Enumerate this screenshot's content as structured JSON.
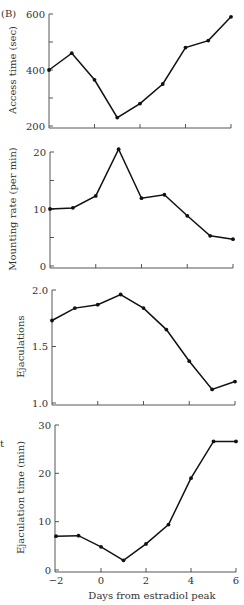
{
  "panel_label": "(B)",
  "edge_fragments": [
    "t"
  ],
  "chart_data": [
    {
      "type": "line",
      "title": "",
      "xlabel": "",
      "ylabel": "Access time (sec)",
      "x": [
        -2,
        -1,
        0,
        1,
        2,
        3,
        4,
        5,
        6
      ],
      "values": [
        400,
        460,
        365,
        230,
        280,
        350,
        480,
        505,
        590
      ],
      "ylim": [
        200,
        600
      ],
      "xlim": [
        -2,
        6
      ],
      "yticks": [
        200,
        300,
        400,
        500,
        600
      ],
      "ytick_labels": [
        "200",
        "",
        "400",
        "",
        "600"
      ],
      "xticks": [
        -2,
        0,
        2,
        4,
        6
      ],
      "xtick_labels": [],
      "grid": false
    },
    {
      "type": "line",
      "title": "",
      "xlabel": "",
      "ylabel": "Mounting rate (per min)",
      "x": [
        -2,
        -1,
        0,
        1,
        2,
        3,
        4,
        5,
        6
      ],
      "values": [
        10.0,
        10.2,
        12.3,
        20.5,
        11.9,
        12.5,
        8.8,
        5.3,
        4.7
      ],
      "ylim": [
        0,
        20
      ],
      "xlim": [
        -2,
        6
      ],
      "yticks": [
        0,
        5,
        10,
        15,
        20
      ],
      "ytick_labels": [
        "0",
        "",
        "10",
        "",
        "20"
      ],
      "xticks": [
        -2,
        0,
        2,
        4,
        6
      ],
      "xtick_labels": [],
      "grid": false
    },
    {
      "type": "line",
      "title": "",
      "xlabel": "",
      "ylabel": "Ejaculations",
      "x": [
        -2,
        -1,
        0,
        1,
        2,
        3,
        4,
        5,
        6
      ],
      "values": [
        1.73,
        1.84,
        1.87,
        1.96,
        1.84,
        1.65,
        1.37,
        1.12,
        1.19
      ],
      "ylim": [
        1.0,
        2.0
      ],
      "xlim": [
        -2,
        6
      ],
      "yticks": [
        1.0,
        1.5,
        2.0
      ],
      "ytick_labels": [
        "1.0",
        "1.5",
        "2.0"
      ],
      "xticks": [
        -2,
        0,
        2,
        4,
        6
      ],
      "xtick_labels": [],
      "grid": false
    },
    {
      "type": "line",
      "title": "",
      "xlabel": "Days from estradiol peak",
      "ylabel": "Ejaculation time (min)",
      "x": [
        -2,
        -1,
        0,
        1,
        2,
        3,
        4,
        5,
        6
      ],
      "values": [
        7.0,
        7.1,
        4.8,
        2.0,
        5.4,
        9.4,
        19.0,
        26.6,
        26.6
      ],
      "ylim": [
        0,
        30
      ],
      "xlim": [
        -2,
        6
      ],
      "yticks": [
        0,
        10,
        20,
        30
      ],
      "ytick_labels": [
        "0",
        "10",
        "20",
        "30"
      ],
      "xticks": [
        -2,
        0,
        2,
        4,
        6
      ],
      "xtick_labels": [
        "−2",
        "0",
        "2",
        "4",
        "6"
      ],
      "grid": false
    }
  ]
}
